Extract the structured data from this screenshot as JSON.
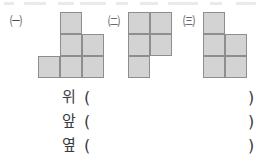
{
  "figures": [
    {
      "label": "㈠",
      "label_name": "figure-label-a",
      "left": 8,
      "grid_left": 30,
      "cubes": [
        {
          "col": 2,
          "row": 1
        },
        {
          "col": 2,
          "row": 2
        },
        {
          "col": 3,
          "row": 2
        },
        {
          "col": 1,
          "row": 3
        },
        {
          "col": 2,
          "row": 3
        },
        {
          "col": 3,
          "row": 3
        }
      ]
    },
    {
      "label": "㈡",
      "label_name": "figure-label-b",
      "left": 106,
      "grid_left": 22,
      "cubes": [
        {
          "col": 1,
          "row": 1
        },
        {
          "col": 2,
          "row": 1
        },
        {
          "col": 1,
          "row": 2
        },
        {
          "col": 2,
          "row": 2
        },
        {
          "col": 1,
          "row": 3
        }
      ]
    },
    {
      "label": "㈢",
      "label_name": "figure-label-c",
      "left": 181,
      "grid_left": 22,
      "cubes": [
        {
          "col": 1,
          "row": 1
        },
        {
          "col": 1,
          "row": 2
        },
        {
          "col": 2,
          "row": 2
        },
        {
          "col": 1,
          "row": 3
        },
        {
          "col": 2,
          "row": 3
        }
      ]
    }
  ],
  "answers": {
    "paren_open": "(",
    "paren_close": ")",
    "rows": [
      {
        "label": "위",
        "name": "answer-row-top",
        "value": ""
      },
      {
        "label": "앞",
        "name": "answer-row-front",
        "value": ""
      },
      {
        "label": "옆",
        "name": "answer-row-side",
        "value": ""
      }
    ]
  },
  "colors": {
    "cube_fill": "#d3d3d3",
    "cube_border": "#8e8e8e",
    "text": "#3c3c3c",
    "background": "#ffffff"
  }
}
